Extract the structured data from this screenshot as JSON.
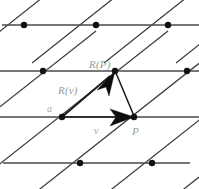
{
  "figure": {
    "background_color": "#ffffff",
    "line_color": "#4a4a4a",
    "diagonal_color": "#3c3c3c",
    "dot_color": "#111111",
    "vector_color": "#0d0d0d",
    "label_color": "#9a9a9a"
  },
  "labels": {
    "r_of_p": "R(P)",
    "r_of_v": "R(v)",
    "a": "a",
    "v": "v",
    "p": "P"
  },
  "label_positions": {
    "r_of_p": {
      "x": 89,
      "y": 68
    },
    "r_of_v": {
      "x": 58,
      "y": 93
    },
    "a": {
      "x": 47,
      "y": 111
    },
    "v": {
      "x": 94,
      "y": 133
    },
    "p": {
      "x": 132,
      "y": 134
    }
  },
  "lattice": {
    "horizontal_lines": [
      {
        "y": 25,
        "x1": 0,
        "x2": 199
      },
      {
        "y": 71,
        "x1": 0,
        "x2": 199
      },
      {
        "y": 117,
        "x1": 0,
        "x2": 199
      },
      {
        "y": 163,
        "x1": 0,
        "x2": 199
      }
    ],
    "row_x_offsets": [
      24,
      43,
      62,
      80
    ],
    "spacing_x": 72,
    "spacing_y": 46,
    "dots": [
      {
        "x": 24,
        "y": 25
      },
      {
        "x": 96,
        "y": 25
      },
      {
        "x": 168,
        "y": 25
      },
      {
        "x": 43,
        "y": 71
      },
      {
        "x": 115,
        "y": 71
      },
      {
        "x": 187,
        "y": 71
      },
      {
        "x": 62,
        "y": 117
      },
      {
        "x": 134,
        "y": 117
      },
      {
        "x": 80,
        "y": 163
      },
      {
        "x": 152,
        "y": 163
      }
    ],
    "dot_radius": 3.1
  },
  "diagonals": [
    {
      "x1": -40,
      "y1": 63,
      "x2": 60,
      "y2": -16
    },
    {
      "x1": 32,
      "y1": 63,
      "x2": 132,
      "y2": -16
    },
    {
      "x1": 104,
      "y1": 63,
      "x2": 204,
      "y2": -16
    },
    {
      "x1": 10,
      "y1": 205,
      "x2": 230,
      "y2": 31
    },
    {
      "x1": -60,
      "y1": 205,
      "x2": 160,
      "y2": 31
    },
    {
      "x1": -130,
      "y1": 205,
      "x2": 90,
      "y2": 31
    },
    {
      "x1": 80,
      "y1": 205,
      "x2": 300,
      "y2": 31
    },
    {
      "x1": 150,
      "y1": 205,
      "x2": 370,
      "y2": 31
    }
  ],
  "vectors": [
    {
      "name": "v",
      "from": {
        "x": 62,
        "y": 117
      },
      "to": {
        "x": 134,
        "y": 117
      },
      "arrow_tip": {
        "x": 134,
        "y": 117
      },
      "label": "v"
    },
    {
      "name": "R(v)",
      "from": {
        "x": 62,
        "y": 117
      },
      "to": {
        "x": 115,
        "y": 71
      },
      "arrow_tip": {
        "x": 115,
        "y": 71
      },
      "label": "R(v)"
    }
  ],
  "connector": {
    "name": "P-to-R(P)",
    "from": {
      "x": 134,
      "y": 117
    },
    "to": {
      "x": 115,
      "y": 71
    }
  }
}
